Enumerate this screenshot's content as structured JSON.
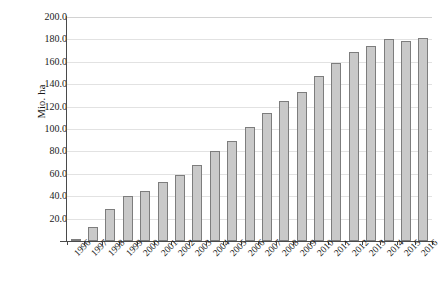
{
  "chart_data": {
    "type": "bar",
    "title": "",
    "subtitle": "",
    "xlabel": "",
    "ylabel": "Mio. ha",
    "ylim": [
      0,
      200
    ],
    "ytick_labels": [
      "200.0",
      "180.0",
      "160.0",
      "140.0",
      "120.0",
      "100.0",
      "80.0",
      "60.0",
      "40.0",
      "20.0",
      "-"
    ],
    "ytick_values": [
      200,
      180,
      160,
      140,
      120,
      100,
      80,
      60,
      40,
      20,
      0
    ],
    "grid": true,
    "legend": "none",
    "categories": [
      "1996",
      "1997",
      "1998",
      "1999",
      "2000",
      "2001",
      "2002",
      "2003",
      "2004",
      "2005",
      "2006",
      "2007",
      "2008",
      "2009",
      "2010",
      "2011",
      "2012",
      "2013",
      "2014",
      "2015",
      "2016"
    ],
    "values": [
      1.7,
      12.5,
      29.0,
      39.8,
      44.3,
      52.5,
      58.6,
      67.5,
      80.6,
      89.6,
      101.5,
      114.0,
      124.6,
      133.4,
      147.0,
      158.8,
      169.0,
      173.7,
      180.5,
      178.4,
      181.0
    ],
    "series": [
      {
        "name": "Mio. ha",
        "values": [
          1.7,
          12.5,
          29.0,
          39.8,
          44.3,
          52.5,
          58.6,
          67.5,
          80.6,
          89.6,
          101.5,
          114.0,
          124.6,
          133.4,
          147.0,
          158.8,
          169.0,
          173.7,
          180.5,
          178.4,
          181.0
        ]
      }
    ],
    "bar_fill_color": "#c9c9c9",
    "bar_border_color": "#7d7d7d",
    "gridline_color": "#e2e2e2",
    "axis_color": "#4a4a4a"
  }
}
